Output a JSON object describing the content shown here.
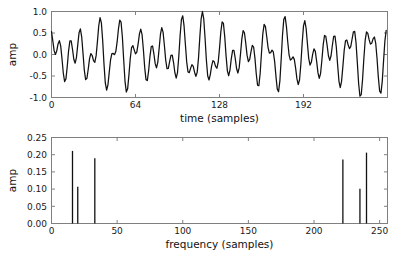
{
  "chart_data": [
    {
      "type": "line",
      "title": "",
      "xlabel": "time (samples)",
      "ylabel": "amp",
      "xlim": [
        0,
        256
      ],
      "ylim": [
        -1.0,
        1.0
      ],
      "xticks": [
        0,
        64,
        128,
        192
      ],
      "xticklabels": [
        "0",
        "64",
        "128",
        "192"
      ],
      "yticks": [
        -1.0,
        -0.5,
        0.0,
        0.5,
        1.0
      ],
      "yticklabels": [
        "-1.0",
        "-0.5",
        "0.0",
        "0.5",
        "1.0"
      ],
      "grid": false,
      "legend": null,
      "series": [
        {
          "name": "signal",
          "color": "#111111",
          "description": "Sum of three sinusoids at sample frequencies 16, 20 and 33 with amplitudes 0.42, 0.21 and 0.38",
          "components": [
            {
              "freq_bin": 16,
              "amplitude": 0.42,
              "phase": 0.35
            },
            {
              "freq_bin": 20,
              "amplitude": 0.21,
              "phase": 1.95
            },
            {
              "freq_bin": 33,
              "amplitude": 0.38,
              "phase": 2.6
            }
          ],
          "n_samples": 256
        }
      ]
    },
    {
      "type": "bar",
      "title": "",
      "xlabel": "frequency (samples)",
      "ylabel": "amp",
      "xlim": [
        0,
        256
      ],
      "ylim": [
        0.0,
        0.25
      ],
      "xticks": [
        0,
        50,
        100,
        150,
        200,
        250
      ],
      "xticklabels": [
        "0",
        "50",
        "100",
        "150",
        "200",
        "250"
      ],
      "yticks": [
        0.0,
        0.05,
        0.1,
        0.15,
        0.2,
        0.25
      ],
      "yticklabels": [
        "0.00",
        "0.05",
        "0.10",
        "0.15",
        "0.20",
        "0.25"
      ],
      "grid": false,
      "legend": null,
      "categories": [
        16,
        20,
        33,
        222,
        235,
        240
      ],
      "values": [
        0.211,
        0.107,
        0.19,
        0.186,
        0.101,
        0.206
      ],
      "bar_color": "#111111"
    }
  ]
}
